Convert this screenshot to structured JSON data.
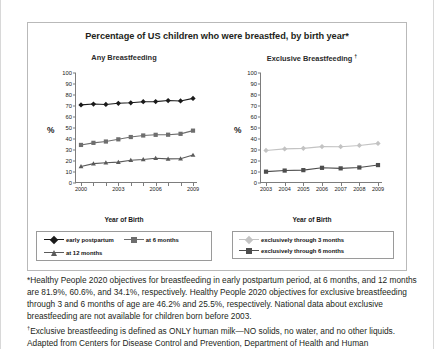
{
  "figure": {
    "title": "Percentage of US children who were breastfed, by birth year*"
  },
  "panels": {
    "left": {
      "title": "Any Breastfeeding",
      "title_sup": "",
      "ylabel": "%",
      "xlabel": "Year of Birth"
    },
    "right": {
      "title": "Exclusive Breastfeeding ",
      "title_sup": "†",
      "ylabel": "%",
      "xlabel": "Year of Birth"
    }
  },
  "legend_left": [
    {
      "label": "early postpartum",
      "color": "#1a1a1a",
      "marker": "diamond"
    },
    {
      "label": "at 6 months",
      "color": "#6e6e6e",
      "marker": "square"
    },
    {
      "label": "at 12 months",
      "color": "#5a5a5a",
      "marker": "triangle"
    }
  ],
  "legend_right": [
    {
      "label": "exclusively through 3 months",
      "color": "#c3c3c3",
      "marker": "diamond"
    },
    {
      "label": "exclusively through 6 months",
      "color": "#4d4d4d",
      "marker": "square"
    }
  ],
  "notes": {
    "line1": "*Healthy People 2020 objectives for breastfeeding in early postpartum period, at 6 months, and 12 months are 81.9%, 60.6%, and 34.1%, respectively. Healthy People 2020 objectives for exclusive breastfeeding through 3 and 6 months of age are 46.2% and 25.5%, respectively. National data about exclusive breastfeeding are not available for children born before 2003.",
    "line2_sup": "†",
    "line2": "Exclusive breastfeeding is defined as ONLY human milk—NO solids, no water, and no other liquids.",
    "line3": "Adapted from Centers for Disease Control and Prevention, Department of Health and Human"
  },
  "chart_data": [
    {
      "type": "line",
      "title": "Any Breastfeeding",
      "xlabel": "Year of Birth",
      "ylabel": "%",
      "ylim": [
        0,
        100
      ],
      "ytick_step": 10,
      "yticks": [
        0,
        10,
        20,
        30,
        40,
        50,
        60,
        70,
        80,
        90,
        100
      ],
      "x": [
        2000,
        2001,
        2002,
        2003,
        2004,
        2005,
        2006,
        2007,
        2008,
        2009
      ],
      "xtick_labels": [
        "2000",
        "2003",
        "2006",
        "2009"
      ],
      "xtick_label_positions": [
        2000,
        2003,
        2006,
        2009
      ],
      "grid": false,
      "legend_position": "below",
      "series": [
        {
          "name": "early postpartum",
          "color": "#1a1a1a",
          "marker": "diamond",
          "values": [
            71.0,
            71.8,
            71.4,
            72.5,
            72.9,
            73.9,
            74.0,
            75.0,
            74.6,
            76.9
          ]
        },
        {
          "name": "at 6 months",
          "color": "#6e6e6e",
          "marker": "square",
          "values": [
            34.6,
            36.5,
            37.7,
            39.7,
            41.8,
            43.2,
            43.8,
            43.9,
            44.7,
            47.6
          ]
        },
        {
          "name": "at 12 months",
          "color": "#5a5a5a",
          "marker": "triangle",
          "values": [
            15.0,
            17.6,
            18.4,
            19.0,
            20.7,
            21.4,
            22.5,
            21.9,
            22.1,
            25.4
          ]
        }
      ]
    },
    {
      "type": "line",
      "title": "Exclusive Breastfeeding",
      "xlabel": "Year of Birth",
      "ylabel": "%",
      "ylim": [
        0,
        100
      ],
      "ytick_step": 10,
      "yticks": [
        0,
        10,
        20,
        30,
        40,
        50,
        60,
        70,
        80,
        90,
        100
      ],
      "x": [
        2003,
        2004,
        2005,
        2006,
        2007,
        2008,
        2009
      ],
      "xtick_labels": [
        "2003",
        "2004",
        "2005",
        "2006",
        "2007",
        "2008",
        "2009"
      ],
      "grid": false,
      "legend_position": "below",
      "series": [
        {
          "name": "exclusively through 3 months",
          "color": "#c3c3c3",
          "marker": "diamond",
          "values": [
            29.6,
            31.0,
            31.5,
            33.1,
            33.0,
            34.1,
            36.0
          ]
        },
        {
          "name": "exclusively through 6 months",
          "color": "#4d4d4d",
          "marker": "square",
          "values": [
            10.3,
            11.3,
            11.7,
            13.8,
            13.3,
            14.1,
            16.3
          ]
        }
      ]
    }
  ]
}
